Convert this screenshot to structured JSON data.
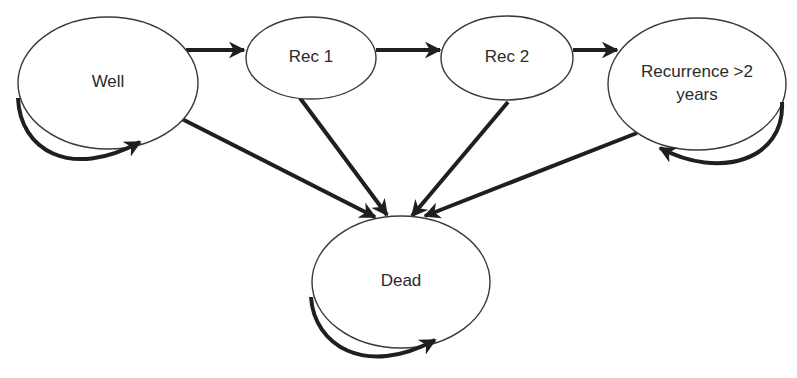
{
  "diagram": {
    "type": "state-transition",
    "nodes": [
      {
        "id": "well",
        "label_lines": [
          "Well"
        ],
        "cx": 108,
        "cy": 83,
        "rx": 90,
        "ry": 66
      },
      {
        "id": "rec1",
        "label_lines": [
          "Rec 1"
        ],
        "cx": 311,
        "cy": 58,
        "rx": 65,
        "ry": 41
      },
      {
        "id": "rec2",
        "label_lines": [
          "Rec 2"
        ],
        "cx": 507,
        "cy": 58,
        "rx": 66,
        "ry": 42
      },
      {
        "id": "recurrence",
        "label_lines": [
          "Recurrence >2",
          "years"
        ],
        "cx": 697,
        "cy": 84,
        "rx": 89,
        "ry": 66
      },
      {
        "id": "dead",
        "label_lines": [
          "Dead"
        ],
        "cx": 401,
        "cy": 282,
        "rx": 89,
        "ry": 66
      }
    ],
    "edges": [
      {
        "from": "well",
        "to": "rec1",
        "path": "M186,50 L244,50"
      },
      {
        "from": "rec1",
        "to": "rec2",
        "path": "M376,50 L440,50"
      },
      {
        "from": "rec2",
        "to": "recurrence",
        "path": "M573,50 L617,50"
      },
      {
        "from": "well",
        "to": "dead",
        "path": "M182,119 L375,217"
      },
      {
        "from": "rec1",
        "to": "dead",
        "path": "M300,98 L387,215"
      },
      {
        "from": "rec2",
        "to": "dead",
        "path": "M508,102 L412,216"
      },
      {
        "from": "recurrence",
        "to": "dead",
        "path": "M637,133 L425,216"
      },
      {
        "from": "well",
        "to": "well",
        "self_loop": true,
        "path": "M18,98 C20,150 70,180 140,142"
      },
      {
        "from": "recurrence",
        "to": "recurrence",
        "self_loop": true,
        "path": "M782,102 C785,160 720,180 660,148"
      },
      {
        "from": "dead",
        "to": "dead",
        "self_loop": true,
        "path": "M311,297 C314,345 365,378 435,340"
      }
    ],
    "colors": {
      "node_stroke": "#3a3a3a",
      "edge": "#1f1f1f",
      "text": "#2b2b2b",
      "background": "#ffffff"
    }
  }
}
